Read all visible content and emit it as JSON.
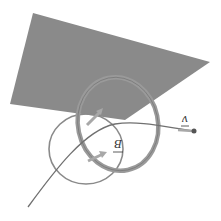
{
  "diagram": {
    "type": "physics-illustration",
    "orientation": "rotated 180 degrees",
    "colors": {
      "plane": "#8a8a8a",
      "ribbon": "#9a9a9a",
      "ribbon_edge": "#6e6e6e",
      "curve": "#707070",
      "arrow": "#a8a8a8",
      "label": "#333333"
    },
    "elements": {
      "plane": "shaded plane",
      "field_loop_large": "magnetic field ribbon loop (large)",
      "field_loop_small": "magnetic field loop (small)",
      "trajectory": "curved path",
      "velocity_vector": "velocity arrow"
    },
    "labels": {
      "magnetic_field": "B",
      "velocity": "v"
    }
  }
}
